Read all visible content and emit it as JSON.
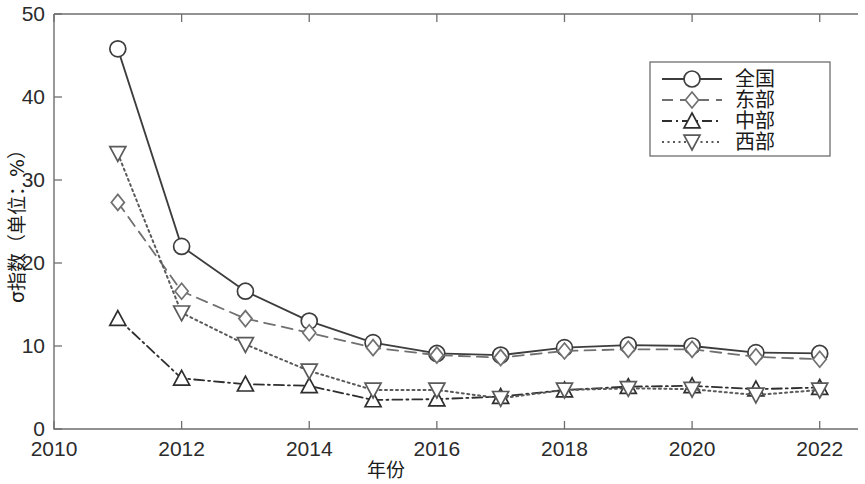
{
  "chart_data": {
    "type": "line",
    "title": "",
    "xlabel": "年份",
    "ylabel": "σ指数（单位：%）",
    "xlim": [
      2010,
      2022.6
    ],
    "ylim": [
      0,
      50
    ],
    "xticks": [
      2010,
      2012,
      2014,
      2016,
      2018,
      2020,
      2022
    ],
    "xtick_labels": [
      "2010",
      "2012",
      "2014",
      "2016",
      "2018",
      "2020",
      "2022"
    ],
    "yticks": [
      0,
      10,
      20,
      30,
      40,
      50
    ],
    "ytick_labels": [
      "0",
      "10",
      "20",
      "30",
      "40",
      "50"
    ],
    "grid": false,
    "legend_position": "upper right",
    "x": [
      2011,
      2012,
      2013,
      2014,
      2015,
      2016,
      2017,
      2018,
      2019,
      2020,
      2021,
      2022
    ],
    "series": [
      {
        "name": "全国",
        "marker": "circle",
        "linestyle": "solid",
        "color": "#3d3d3d",
        "values": [
          45.8,
          22.0,
          16.6,
          13.0,
          10.4,
          9.1,
          8.9,
          9.8,
          10.1,
          10.0,
          9.2,
          9.1
        ]
      },
      {
        "name": "东部",
        "marker": "diamond",
        "linestyle": "dashed",
        "color": "#707070",
        "values": [
          27.3,
          16.6,
          13.3,
          11.6,
          9.8,
          8.9,
          8.6,
          9.4,
          9.6,
          9.6,
          8.7,
          8.4
        ]
      },
      {
        "name": "中部",
        "marker": "triangle-up",
        "linestyle": "dash-dot",
        "color": "#2e2e2e",
        "values": [
          13.3,
          6.1,
          5.4,
          5.2,
          3.5,
          3.6,
          3.9,
          4.7,
          5.1,
          5.2,
          4.8,
          5.0
        ]
      },
      {
        "name": "西部",
        "marker": "triangle-down",
        "linestyle": "dotted",
        "color": "#5a5a5a",
        "values": [
          33.2,
          14.0,
          10.2,
          7.0,
          4.7,
          4.7,
          3.7,
          4.7,
          4.9,
          4.8,
          4.1,
          4.7
        ]
      }
    ]
  },
  "legend": {
    "items": [
      {
        "label": "全国"
      },
      {
        "label": "东部"
      },
      {
        "label": "中部"
      },
      {
        "label": "西部"
      }
    ]
  },
  "axes": {
    "y_axis_title": "σ指数（单位：%）",
    "x_axis_title": "年份"
  }
}
